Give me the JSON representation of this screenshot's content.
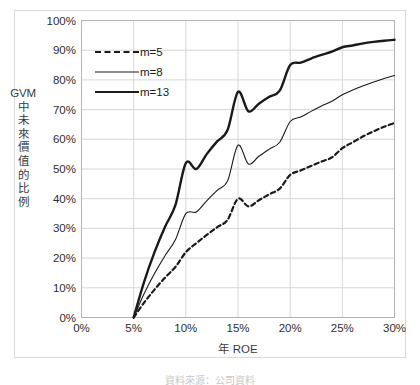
{
  "figure": {
    "background_color": "#ffffff",
    "border_color": "#d9d9d9"
  },
  "axis": {
    "y_title_latin": "GVM",
    "y_title_cjk": "中未來價值的比例",
    "x_title": "年 ROE",
    "y_ticks": [
      "100%",
      "90%",
      "80%",
      "70%",
      "60%",
      "50%",
      "40%",
      "30%",
      "20%",
      "10%",
      "0%"
    ],
    "x_ticks": [
      "0%",
      "5%",
      "10%",
      "15%",
      "20%",
      "25%",
      "30%"
    ]
  },
  "legend": {
    "items": [
      {
        "label": "m=5",
        "style": "dashed"
      },
      {
        "label": "m=8",
        "style": "thin"
      },
      {
        "label": "m=13",
        "style": "thick"
      }
    ]
  },
  "caption": {
    "text": "資料來源：公司資料"
  },
  "chart_data": {
    "type": "line",
    "title": "",
    "subtitle": "",
    "xlabel": "年 ROE",
    "ylabel": "GVM 中未來價值的比例",
    "xlim": [
      0,
      30
    ],
    "ylim": [
      0,
      100
    ],
    "x_unit": "%",
    "y_unit": "%",
    "xticks": [
      0,
      5,
      10,
      15,
      20,
      25,
      30
    ],
    "yticks": [
      0,
      10,
      20,
      30,
      40,
      50,
      60,
      70,
      80,
      90,
      100
    ],
    "grid": true,
    "legend_position": "inside-top-left",
    "x": [
      5,
      6,
      7,
      8,
      9,
      10,
      11,
      12,
      13,
      14,
      15,
      16,
      17,
      18,
      19,
      20,
      21,
      22,
      23,
      24,
      25,
      26,
      27,
      28,
      29,
      30
    ],
    "series": [
      {
        "name": "m=5",
        "style": "dashed",
        "color": "#1a1a1a",
        "values": [
          0,
          5.0,
          9.4,
          13.4,
          17.0,
          22.0,
          25.0,
          27.8,
          30.4,
          32.9,
          40.0,
          37.4,
          39.5,
          41.5,
          43.4,
          48.0,
          49.5,
          51.0,
          52.5,
          53.9,
          57.0,
          59.0,
          61.0,
          62.7,
          64.2,
          65.5
        ]
      },
      {
        "name": "m=8",
        "style": "thin",
        "color": "#1a1a1a",
        "values": [
          0,
          8.0,
          14.8,
          20.8,
          26.2,
          35.0,
          35.5,
          39.3,
          42.8,
          46.0,
          58.0,
          51.7,
          54.3,
          56.7,
          59.0,
          66.0,
          67.5,
          69.4,
          71.2,
          72.8,
          75.0,
          76.6,
          78.0,
          79.3,
          80.5,
          81.5
        ]
      },
      {
        "name": "m=13",
        "style": "thick",
        "color": "#1a1a1a",
        "values": [
          0,
          12.0,
          22.0,
          30.5,
          37.8,
          52.0,
          50.0,
          55.0,
          59.3,
          63.1,
          76.0,
          69.4,
          72.0,
          74.3,
          76.4,
          85.0,
          85.8,
          87.2,
          88.4,
          89.5,
          91.0,
          91.6,
          92.3,
          92.8,
          93.2,
          93.5
        ]
      }
    ]
  }
}
